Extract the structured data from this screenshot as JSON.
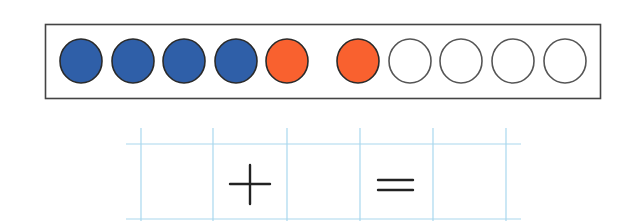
{
  "colors": {
    "blue": "#2f5fa8",
    "red": "#f9612f",
    "empty": "#ffffff",
    "outline": "#333333",
    "frame": "#444444",
    "grid": "#a9d8ee",
    "symbol": "#222222"
  },
  "counter_frame": {
    "circles": [
      {
        "index": 1,
        "color": "blue"
      },
      {
        "index": 2,
        "color": "blue"
      },
      {
        "index": 3,
        "color": "blue"
      },
      {
        "index": 4,
        "color": "blue"
      },
      {
        "index": 5,
        "color": "red"
      },
      {
        "index": 6,
        "color": "red"
      },
      {
        "index": 7,
        "color": "empty"
      },
      {
        "index": 8,
        "color": "empty"
      },
      {
        "index": 9,
        "color": "empty"
      },
      {
        "index": 10,
        "color": "empty"
      }
    ],
    "counts": {
      "blue": 4,
      "red": 2,
      "empty": 4,
      "total": 10
    }
  },
  "equation": {
    "cells": [
      "",
      "+",
      "",
      "=",
      ""
    ],
    "operator": "+",
    "equals": "="
  }
}
